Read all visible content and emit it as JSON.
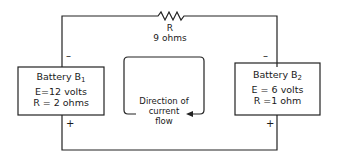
{
  "resistor": {
    "name": "R",
    "value": "9 ohms"
  },
  "battery1": {
    "title": "Battery B",
    "subscript": "1",
    "emf": "E=12  volts",
    "resistance": "R = 2  ohms",
    "top_sign": "–",
    "bottom_sign": "+"
  },
  "battery2": {
    "title": "Battery B",
    "subscript": "2",
    "emf": "E = 6 volts",
    "resistance": "R =1 ohm",
    "top_sign": "–",
    "bottom_sign": "+"
  },
  "current": {
    "line1": "Direction of",
    "line2": "current",
    "line3": "flow"
  }
}
